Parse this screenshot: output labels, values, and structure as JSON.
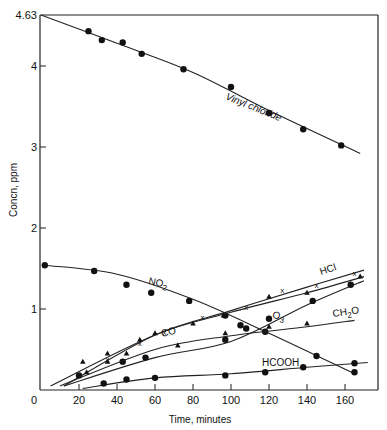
{
  "chart_data": {
    "type": "line",
    "title": "",
    "xlabel": "Time, minutes",
    "ylabel": "Concn, ppm",
    "xlim": [
      0,
      175
    ],
    "ylim": [
      0,
      4.63
    ],
    "x_ticks": [
      0,
      20,
      40,
      60,
      80,
      100,
      120,
      140,
      160
    ],
    "y_ticks": [
      "0",
      "1",
      "2",
      "3",
      "4",
      "4.63"
    ],
    "grid": false,
    "legend": "inline labels on curves",
    "series": [
      {
        "name": "Vinyl chloride",
        "marker": "circle",
        "points": [
          [
            25,
            4.43
          ],
          [
            32,
            4.32
          ],
          [
            43,
            4.29
          ],
          [
            53,
            4.15
          ],
          [
            75,
            3.96
          ],
          [
            100,
            3.74
          ],
          [
            120,
            3.42
          ],
          [
            138,
            3.22
          ],
          [
            158,
            3.02
          ]
        ],
        "line": [
          [
            0,
            4.63
          ],
          [
            40,
            4.28
          ],
          [
            80,
            3.92
          ],
          [
            120,
            3.45
          ],
          [
            168,
            2.92
          ]
        ]
      },
      {
        "name": "NO2",
        "marker": "circle",
        "points": [
          [
            2,
            1.54
          ],
          [
            28,
            1.47
          ],
          [
            45,
            1.3
          ],
          [
            58,
            1.2
          ],
          [
            78,
            1.1
          ],
          [
            97,
            0.92
          ],
          [
            105,
            0.8
          ],
          [
            118,
            0.72
          ],
          [
            145,
            0.42
          ],
          [
            165,
            0.22
          ]
        ],
        "line": [
          [
            2,
            1.54
          ],
          [
            40,
            1.43
          ],
          [
            80,
            1.12
          ],
          [
            120,
            0.7
          ],
          [
            165,
            0.2
          ]
        ]
      },
      {
        "name": "HCl",
        "marker": "x",
        "points": [
          [
            35,
            0.38
          ],
          [
            52,
            0.58
          ],
          [
            65,
            0.72
          ],
          [
            85,
            0.9
          ],
          [
            108,
            1.03
          ],
          [
            127,
            1.23
          ],
          [
            145,
            1.3
          ],
          [
            165,
            1.45
          ]
        ],
        "line": [
          [
            12,
            0.05
          ],
          [
            60,
            0.68
          ],
          [
            100,
            0.98
          ],
          [
            140,
            1.27
          ],
          [
            170,
            1.48
          ]
        ]
      },
      {
        "name": "CO",
        "marker": "triangle",
        "points": [
          [
            22,
            0.35
          ],
          [
            35,
            0.45
          ],
          [
            52,
            0.62
          ],
          [
            60,
            0.7
          ],
          [
            80,
            0.82
          ],
          [
            96,
            0.92
          ],
          [
            120,
            1.15
          ],
          [
            140,
            1.2
          ],
          [
            168,
            1.4
          ]
        ],
        "line": [
          [
            5,
            0.05
          ],
          [
            60,
            0.68
          ],
          [
            100,
            0.96
          ],
          [
            140,
            1.2
          ],
          [
            170,
            1.4
          ]
        ]
      },
      {
        "name": "O3",
        "marker": "circle",
        "points": [
          [
            20,
            0.18
          ],
          [
            43,
            0.35
          ],
          [
            55,
            0.4
          ],
          [
            97,
            0.62
          ],
          [
            108,
            0.76
          ],
          [
            120,
            0.88
          ],
          [
            143,
            1.1
          ],
          [
            163,
            1.3
          ]
        ],
        "line": [
          [
            12,
            0.05
          ],
          [
            60,
            0.4
          ],
          [
            100,
            0.6
          ],
          [
            140,
            1.05
          ],
          [
            170,
            1.35
          ]
        ]
      },
      {
        "name": "CH2O",
        "marker": "triangle",
        "points": [
          [
            24,
            0.22
          ],
          [
            35,
            0.35
          ],
          [
            45,
            0.45
          ],
          [
            72,
            0.55
          ],
          [
            97,
            0.7
          ],
          [
            120,
            0.78
          ],
          [
            140,
            0.82
          ]
        ],
        "line": [
          [
            10,
            0.05
          ],
          [
            60,
            0.5
          ],
          [
            100,
            0.67
          ],
          [
            140,
            0.78
          ],
          [
            165,
            0.86
          ]
        ]
      },
      {
        "name": "HCOOH",
        "marker": "circle",
        "points": [
          [
            33,
            0.08
          ],
          [
            45,
            0.13
          ],
          [
            60,
            0.15
          ],
          [
            97,
            0.18
          ],
          [
            118,
            0.22
          ],
          [
            138,
            0.28
          ],
          [
            165,
            0.33
          ]
        ],
        "line": [
          [
            22,
            0.02
          ],
          [
            60,
            0.15
          ],
          [
            100,
            0.2
          ],
          [
            140,
            0.28
          ],
          [
            172,
            0.34
          ]
        ]
      }
    ],
    "annotations": [
      "Vinyl chloride",
      "NO2",
      "HCl",
      "CO",
      "O3",
      "CH2O",
      "HCOOH"
    ]
  },
  "labels": {
    "xlabel": "Time, minutes",
    "ylabel": "Concn, ppm",
    "y_top": "4.63",
    "y4": "4",
    "y3": "3",
    "y2": "2",
    "y1": "1",
    "x0": "0",
    "x20": "20",
    "x40": "40",
    "x60": "60",
    "x80": "80",
    "x100": "100",
    "x120": "120",
    "x140": "140",
    "x160": "160",
    "vinyl": "Vinyl chloride",
    "no2": "NO",
    "no2_sub": "2",
    "hcl": "HCl",
    "co": "CO",
    "o3": "O",
    "o3_sub": "3",
    "ch2o_a": "CH",
    "ch2o_sub": "2",
    "ch2o_b": "O",
    "hcooh": "HCOOH"
  }
}
